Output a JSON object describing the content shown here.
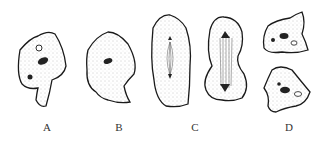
{
  "figure": {
    "panels": [
      {
        "label": "A",
        "x": 47
      },
      {
        "label": "B",
        "x": 119
      },
      {
        "label": "C",
        "x": 195
      },
      {
        "label": "D",
        "x": 289
      }
    ],
    "colors": {
      "outline": "#1a1a1a",
      "fill": "#fafafa",
      "stipple": "#888888"
    }
  }
}
